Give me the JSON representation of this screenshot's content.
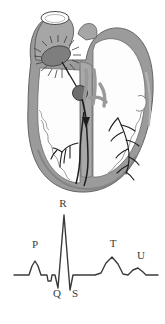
{
  "figure": {
    "background_color": "#ffffff"
  },
  "heart_diagram": {
    "name": "heart-cross-section",
    "description": "Grayscale cross-section of the heart showing the electrical conduction pathway",
    "colors": {
      "myocardium_wall": "#9b9b9b",
      "wall_shadow": "#8a8a8a",
      "wall_highlight": "#b4b4b4",
      "chamber_interior": "#fdfdfd",
      "vessel_gray": "#a6a6a6",
      "conduction_line": "#1e1e1e",
      "sa_node_fill": "#7e7e7e",
      "av_node_fill": "#6e6e6e",
      "outline": "#4a4a4a"
    },
    "structures": [
      {
        "name": "great-vessel-stump",
        "label": ""
      },
      {
        "name": "right-atrium-chamber",
        "label": ""
      },
      {
        "name": "left-atrium-chamber",
        "label": ""
      },
      {
        "name": "right-ventricle-chamber",
        "label": ""
      },
      {
        "name": "left-ventricle-chamber",
        "label": ""
      },
      {
        "name": "interventricular-septum",
        "label": ""
      },
      {
        "name": "sa-node",
        "label": ""
      },
      {
        "name": "av-node",
        "label": ""
      },
      {
        "name": "bundle-of-his",
        "label": ""
      },
      {
        "name": "left-bundle-branch",
        "label": ""
      },
      {
        "name": "right-bundle-branch",
        "label": ""
      },
      {
        "name": "purkinje-fibers-left",
        "label": ""
      },
      {
        "name": "purkinje-fibers-right",
        "label": ""
      },
      {
        "name": "internodal-pathway-arrow",
        "label": ""
      }
    ]
  },
  "chart_data": {
    "type": "line",
    "title": "",
    "subtitle": "",
    "xlabel": "",
    "ylabel": "",
    "grid": false,
    "legend_position": "none",
    "axis_visible": false,
    "line_color": "#3a3a3a",
    "line_width": 1.4,
    "baseline_y": 275,
    "x_range": [
      14,
      158
    ],
    "annotations": [
      {
        "text": "P",
        "x": 35,
        "y": 248
      },
      {
        "text": "R",
        "x": 63,
        "y": 207
      },
      {
        "text": "Q",
        "x": 57,
        "y": 297
      },
      {
        "text": "S",
        "x": 75,
        "y": 297
      },
      {
        "text": "T",
        "x": 113,
        "y": 247
      },
      {
        "text": "U",
        "x": 141,
        "y": 259
      }
    ],
    "waveform_points": "14,275 29,275 32,266 35,261 38,266 41,275 47,275 48,281 51,281 52,275 55,275 58,288 64,215 70,290 73,275 95,275 101,273 106,263 112,257 118,264 123,274 128,275 133,270 138,268 143,272 146,275 158,275",
    "segments": [
      {
        "name": "baseline-start",
        "from_x": 14,
        "to_x": 29,
        "amplitude": 0
      },
      {
        "name": "p-wave",
        "from_x": 29,
        "to_x": 41,
        "amplitude": 14,
        "label": "P"
      },
      {
        "name": "pr-segment",
        "from_x": 41,
        "to_x": 55,
        "amplitude": -6
      },
      {
        "name": "q-deflection",
        "from_x": 55,
        "to_x": 58,
        "amplitude": -13,
        "label": "Q"
      },
      {
        "name": "r-spike",
        "from_x": 58,
        "to_x": 64,
        "amplitude": 60,
        "label": "R"
      },
      {
        "name": "s-deflection",
        "from_x": 64,
        "to_x": 70,
        "amplitude": -15,
        "label": "S"
      },
      {
        "name": "st-segment",
        "from_x": 73,
        "to_x": 95,
        "amplitude": 0
      },
      {
        "name": "t-wave",
        "from_x": 95,
        "to_x": 128,
        "amplitude": 18,
        "label": "T"
      },
      {
        "name": "u-wave",
        "from_x": 128,
        "to_x": 146,
        "amplitude": 7,
        "label": "U"
      },
      {
        "name": "baseline-end",
        "from_x": 146,
        "to_x": 158,
        "amplitude": 0
      }
    ]
  }
}
